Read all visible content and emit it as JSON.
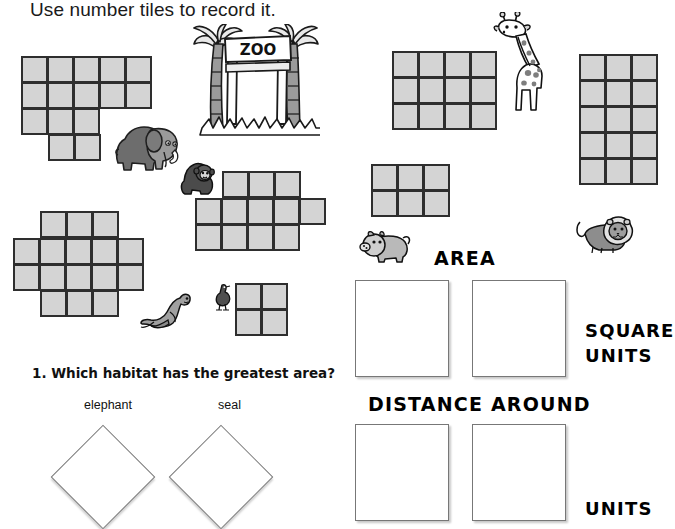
{
  "page": {
    "title": "Use number tiles to record it.",
    "width": 654,
    "height": 521,
    "background": "#ffffff"
  },
  "colors": {
    "tile_fill": "#d4d4d4",
    "tile_stroke": "#2e2e2e",
    "box_stroke": "#777777",
    "text": "#111111"
  },
  "tile_shapes": [
    {
      "id": "elephant-habitat",
      "name": "elephant-habitat-grid",
      "x": 22,
      "y": 57,
      "cell": 27,
      "rows": [
        {
          "offset": 0,
          "count": 5
        },
        {
          "offset": 0,
          "count": 5
        },
        {
          "offset": 0,
          "count": 3
        },
        {
          "offset": 1,
          "count": 2
        }
      ],
      "total_cells": 15
    },
    {
      "id": "seal-habitat",
      "name": "seal-habitat-grid",
      "x": 14,
      "y": 212,
      "cell": 27,
      "rows": [
        {
          "offset": 1,
          "count": 3
        },
        {
          "offset": 0,
          "count": 5
        },
        {
          "offset": 0,
          "count": 5
        },
        {
          "offset": 1,
          "count": 3
        }
      ],
      "total_cells": 16
    },
    {
      "id": "gorilla-habitat",
      "name": "gorilla-habitat-grid",
      "x": 196,
      "y": 172,
      "cell": 27,
      "rows": [
        {
          "offset": 1,
          "count": 3
        },
        {
          "offset": 0,
          "count": 5
        },
        {
          "offset": 0,
          "count": 4
        }
      ],
      "total_cells": 12
    },
    {
      "id": "ostrich-habitat",
      "name": "ostrich-habitat-grid",
      "x": 236,
      "y": 284,
      "cell": 27,
      "rows": [
        {
          "offset": 0,
          "count": 2
        },
        {
          "offset": 0,
          "count": 2
        }
      ],
      "total_cells": 4
    },
    {
      "id": "giraffe-habitat",
      "name": "giraffe-habitat-grid",
      "x": 393,
      "y": 52,
      "cell": 27,
      "rows": [
        {
          "offset": 0,
          "count": 4
        },
        {
          "offset": 0,
          "count": 4
        },
        {
          "offset": 0,
          "count": 4
        }
      ],
      "total_cells": 12
    },
    {
      "id": "pig-habitat",
      "name": "pig-habitat-grid",
      "x": 372,
      "y": 165,
      "cell": 27,
      "rows": [
        {
          "offset": 0,
          "count": 3
        },
        {
          "offset": 0,
          "count": 3
        }
      ],
      "total_cells": 6
    },
    {
      "id": "lion-habitat",
      "name": "lion-habitat-grid",
      "x": 580,
      "y": 55,
      "cell": 27,
      "rows": [
        {
          "offset": 0,
          "count": 3
        },
        {
          "offset": 0,
          "count": 3
        },
        {
          "offset": 0,
          "count": 3
        },
        {
          "offset": 0,
          "count": 3
        },
        {
          "offset": 0,
          "count": 3
        }
      ],
      "total_cells": 15,
      "clipped_right": true
    }
  ],
  "labels": {
    "area": "AREA",
    "distance_around": "DISTANCE AROUND",
    "square": "SQUARE",
    "units_area": "UNITS",
    "units_perimeter": "UNITS"
  },
  "answer_boxes": [
    {
      "name": "area-answer-box-1",
      "x": 355,
      "y": 280,
      "w": 94,
      "h": 97
    },
    {
      "name": "area-answer-box-2",
      "x": 472,
      "y": 280,
      "w": 94,
      "h": 97
    },
    {
      "name": "perimeter-answer-box-1",
      "x": 355,
      "y": 424,
      "w": 94,
      "h": 97
    },
    {
      "name": "perimeter-answer-box-2",
      "x": 472,
      "y": 424,
      "w": 94,
      "h": 97
    }
  ],
  "question": {
    "number_text": "1. Which habitat has the greatest area?",
    "choices": [
      {
        "label": "elephant",
        "label_x": 84,
        "label_y": 398,
        "shape_x": 66,
        "shape_y": 440
      },
      {
        "label": "seal",
        "label_x": 218,
        "label_y": 398,
        "shape_x": 184,
        "shape_y": 440
      }
    ]
  },
  "clipart": [
    {
      "name": "zoo-entrance-gate",
      "sign_text": "ZOO",
      "x": 192,
      "y": 24,
      "w": 128,
      "h": 115
    },
    {
      "name": "elephant-clipart",
      "x": 115,
      "y": 123,
      "w": 66,
      "h": 52
    },
    {
      "name": "gorilla-clipart",
      "x": 180,
      "y": 161,
      "w": 36,
      "h": 36
    },
    {
      "name": "giraffe-clipart",
      "x": 493,
      "y": 12,
      "w": 50,
      "h": 102
    },
    {
      "name": "pig-clipart",
      "x": 359,
      "y": 228,
      "w": 52,
      "h": 36
    },
    {
      "name": "seal-clipart",
      "x": 140,
      "y": 290,
      "w": 52,
      "h": 42
    },
    {
      "name": "ostrich-clipart",
      "x": 213,
      "y": 283,
      "w": 20,
      "h": 29
    },
    {
      "name": "lion-clipart",
      "x": 575,
      "y": 214,
      "w": 60,
      "h": 40
    }
  ]
}
